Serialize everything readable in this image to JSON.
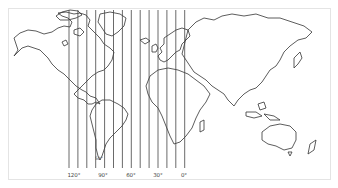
{
  "map": {
    "type": "world-outline-map",
    "meridian_lines": {
      "count": 14,
      "x_start": 69,
      "spacing": 8.9,
      "y_top": 10,
      "y_bottom": 168,
      "color": "#444444"
    },
    "longitude_labels": [
      {
        "text": "120°",
        "x": 74
      },
      {
        "text": "90°",
        "x": 103
      },
      {
        "text": "60°",
        "x": 131
      },
      {
        "text": "30°",
        "x": 158
      },
      {
        "text": "0°",
        "x": 184
      }
    ],
    "latitude_labels": [
      {
        "text": "50°",
        "x": 99,
        "y": 160
      }
    ],
    "frame_color": "#e4e4e4",
    "coastline_color": "#333333"
  }
}
